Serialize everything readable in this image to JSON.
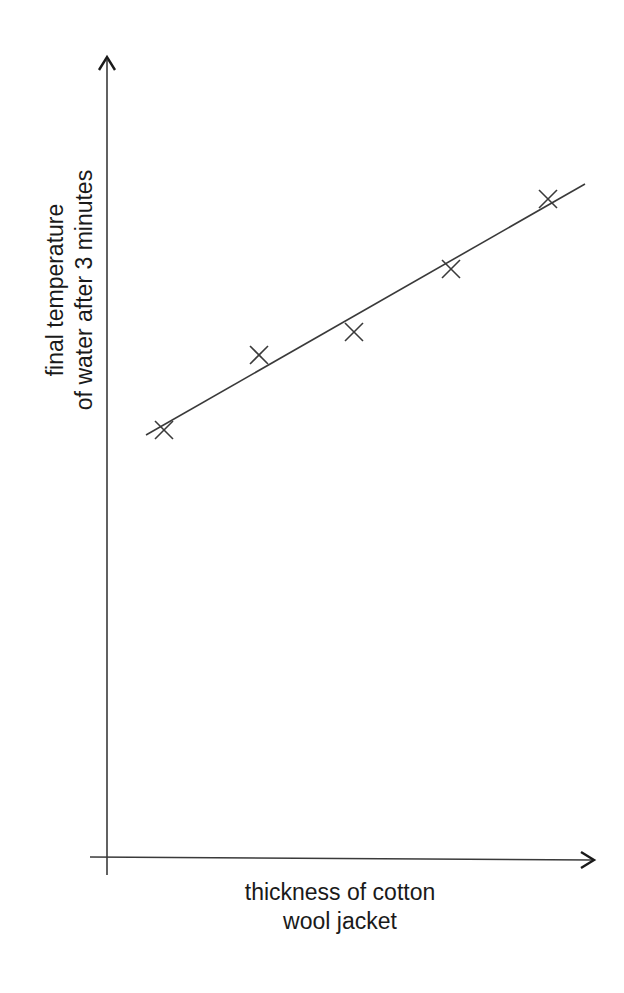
{
  "chart_data": {
    "type": "scatter",
    "title": "",
    "xlabel": "thickness of cotton wool jacket",
    "ylabel": "final temperature of water after 3 minutes",
    "xlabel_lines": [
      "thickness of cotton",
      "wool jacket"
    ],
    "ylabel_lines": [
      "final temperature",
      "of water after 3 minutes"
    ],
    "grid": false,
    "legend": null,
    "axis_ticks": "none",
    "marker": "x",
    "points_pixel": [
      {
        "x": 164,
        "y": 430
      },
      {
        "x": 259,
        "y": 355
      },
      {
        "x": 354,
        "y": 332
      },
      {
        "x": 451,
        "y": 269
      },
      {
        "x": 548,
        "y": 199
      }
    ],
    "points_relative": [
      {
        "x": 0.12,
        "y": 0.55
      },
      {
        "x": 0.32,
        "y": 0.64
      },
      {
        "x": 0.51,
        "y": 0.67
      },
      {
        "x": 0.71,
        "y": 0.75
      },
      {
        "x": 0.9,
        "y": 0.84
      }
    ],
    "best_fit_line": {
      "x1": 146,
      "y1": 435,
      "x2": 585,
      "y2": 184,
      "trend": "positive linear"
    },
    "axes": {
      "origin": {
        "x": 107,
        "y": 857
      },
      "x_axis_end": 594,
      "y_axis_top": 57
    },
    "colors": {
      "stroke": "#3a3a3a",
      "text": "#1a1a1a",
      "background": "#ffffff"
    }
  }
}
